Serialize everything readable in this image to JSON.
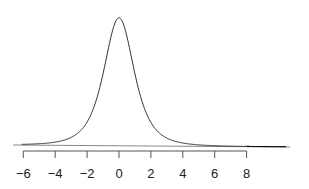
{
  "chart_data": {
    "type": "line",
    "title": "",
    "xlabel": "",
    "ylabel": "",
    "x_ticks": [
      -6,
      -4,
      -2,
      0,
      2,
      4,
      6,
      8
    ],
    "x_tick_labels": [
      "−6",
      "−4",
      "−2",
      "0",
      "2",
      "4",
      "6",
      "8"
    ],
    "xlim": [
      -6,
      10.5
    ],
    "center": 0,
    "shaded_region": {
      "from": 8,
      "to": 10.5,
      "side": "right tail"
    },
    "grid": false,
    "legend": null
  },
  "colors": {
    "curve": "#333333",
    "axis": "#555555",
    "baseline": "#888888",
    "shade": "#000000"
  }
}
